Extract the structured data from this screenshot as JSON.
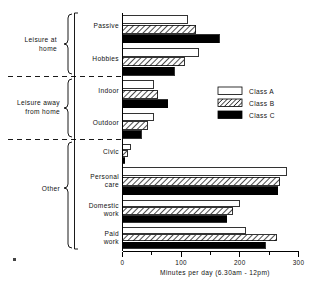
{
  "chart_data": {
    "type": "bar",
    "orientation": "horizontal",
    "title": "",
    "xlabel": "Minutes per day (6.30am - 12pm)",
    "ylabel": "",
    "xlim": [
      0,
      300
    ],
    "xticks": [
      0,
      100,
      200,
      300
    ],
    "xtick_labels": [
      "0",
      "100",
      "200",
      "300"
    ],
    "xminorticks": [
      50,
      150,
      250
    ],
    "grid": false,
    "legend_position": "center-right",
    "categories": [
      "Passive",
      "Hobbies",
      "Indoor",
      "Outdoor",
      "Civic",
      "Personal care",
      "Domestic work",
      "Paid work"
    ],
    "category_labels": [
      [
        "Passive"
      ],
      [
        "Hobbies"
      ],
      [
        "Indoor"
      ],
      [
        "Outdoor"
      ],
      [
        "Civic"
      ],
      [
        "Personal",
        "care"
      ],
      [
        "Domestic",
        "work"
      ],
      [
        "Paid",
        "work"
      ]
    ],
    "series": [
      {
        "name": "Class A",
        "fill": "none",
        "values": [
          110,
          130,
          52,
          52,
          14,
          280,
          200,
          210
        ]
      },
      {
        "name": "Class B",
        "fill": "hatch",
        "values": [
          125,
          105,
          60,
          42,
          8,
          268,
          188,
          263
        ]
      },
      {
        "name": "Class C",
        "fill": "solid",
        "values": [
          165,
          88,
          77,
          32,
          4,
          265,
          178,
          243
        ]
      }
    ],
    "groups": [
      {
        "label": [
          "Leisure at",
          "home"
        ],
        "categories": [
          "Passive",
          "Hobbies"
        ]
      },
      {
        "label": [
          "Leisure away",
          "from home"
        ],
        "categories": [
          "Indoor",
          "Outdoor"
        ]
      },
      {
        "label": [
          "Other"
        ],
        "categories": [
          "Civic",
          "Personal care",
          "Domestic work",
          "Paid work"
        ]
      }
    ]
  },
  "legend": {
    "items": [
      {
        "label": "Class A",
        "swatch": "empty-swatch"
      },
      {
        "label": "Class B",
        "swatch": "hatched-swatch"
      },
      {
        "label": "Class C",
        "swatch": "solid-swatch"
      }
    ]
  },
  "colors": {
    "line": "#000000",
    "class_a": "#ffffff",
    "class_b": "#ffffff",
    "class_c": "#000000",
    "background": "#ffffff"
  },
  "axis": {
    "x_label": "Minutes per day (6.30am - 12pm)",
    "tick_labels": [
      "0",
      "100",
      "200",
      "300"
    ]
  }
}
